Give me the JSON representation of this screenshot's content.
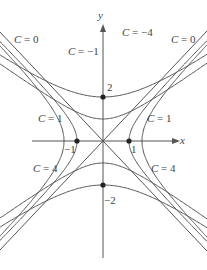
{
  "diagram": {
    "axes": {
      "x_label": "x",
      "y_label": "y"
    },
    "origin_px": [
      103,
      141
    ],
    "unit_px": [
      26,
      22
    ],
    "ticks": {
      "x_pos": "1",
      "x_neg": "−1",
      "y_pos": "2",
      "y_neg": "−2"
    },
    "points": [
      [
        0,
        2
      ],
      [
        0,
        -2
      ],
      [
        1,
        0
      ],
      [
        -1,
        0
      ]
    ],
    "level_values": [
      -4,
      -1,
      0,
      1,
      4
    ],
    "extra_curves": {
      "y_vertex_offsets": [
        -0.5,
        -1.3,
        -2.0
      ]
    },
    "labels": [
      {
        "text": "C = 0",
        "x": 14,
        "y": 34
      },
      {
        "text": "C = −4",
        "x": 122,
        "y": 27
      },
      {
        "text": "C = 0",
        "x": 171,
        "y": 34
      },
      {
        "text": "C = −1",
        "x": 68,
        "y": 46
      },
      {
        "text": "C = 1",
        "x": 38,
        "y": 113
      },
      {
        "text": "C = 1",
        "x": 147,
        "y": 113
      },
      {
        "text": "C = 4",
        "x": 33,
        "y": 163
      },
      {
        "text": "C = 4",
        "x": 151,
        "y": 163
      }
    ],
    "curve_color": "#555555"
  }
}
